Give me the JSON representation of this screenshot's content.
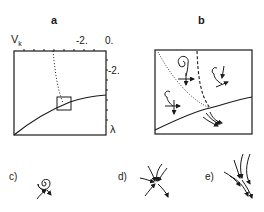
{
  "panels": {
    "a": {
      "letter": "a",
      "y_axis_label": "V_k",
      "y_axis_label_main": "V",
      "y_axis_label_sub": "k",
      "x_axis_label": "λ",
      "top_tick_labels": [
        "-2.",
        "0."
      ],
      "right_tick_labels": [
        "-2."
      ]
    },
    "b": {
      "letter": "b"
    },
    "c": {
      "label": "c)"
    },
    "d": {
      "label": "d)"
    },
    "e": {
      "label": "e)"
    }
  }
}
